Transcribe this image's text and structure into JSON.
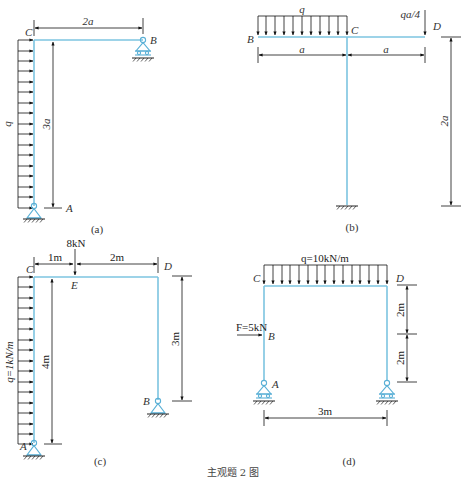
{
  "figure": {
    "caption": "主观题 2 图",
    "colors": {
      "member": "#7cc4e0",
      "support": "#5ab0d6",
      "annotation": "#111111"
    }
  },
  "panels": [
    {
      "id": "a",
      "label": "(a)",
      "nodes": {
        "C": "C",
        "B": "B",
        "A": "A"
      },
      "load_label": "q",
      "dims": {
        "horizontal": "2a",
        "vertical": "3a"
      }
    },
    {
      "id": "b",
      "label": "(b)",
      "nodes": {
        "B": "B",
        "C": "C",
        "D": "D"
      },
      "load_label": "q",
      "point_load_label": "qa/4",
      "dims": {
        "left": "a",
        "right": "a",
        "vertical": "2a"
      }
    },
    {
      "id": "c",
      "label": "(c)",
      "nodes": {
        "C": "C",
        "E": "E",
        "D": "D",
        "B": "B",
        "A": "A"
      },
      "load_label": "q=1kN/m",
      "point_load_label": "8kN",
      "dims": {
        "left": "1m",
        "right": "2m",
        "left_vertical": "4m",
        "right_vertical": "3m"
      }
    },
    {
      "id": "d",
      "label": "(d)",
      "nodes": {
        "C": "C",
        "D": "D",
        "B": "B",
        "A": "A"
      },
      "load_label": "q=10kN/m",
      "point_load_label": "F=5kN",
      "dims": {
        "upper": "2m",
        "lower": "2m",
        "horizontal": "3m"
      }
    }
  ]
}
